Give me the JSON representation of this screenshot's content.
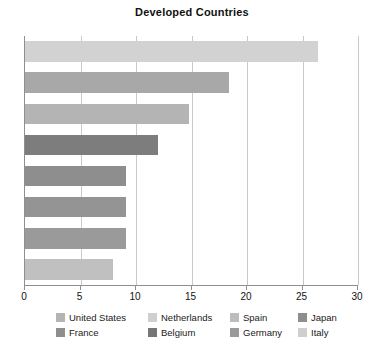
{
  "chart_data": {
    "type": "bar",
    "orientation": "horizontal",
    "title": "Developed Countries",
    "xlabel": "",
    "ylabel": "",
    "xlim": [
      0,
      30
    ],
    "xticks": [
      0,
      5,
      10,
      15,
      20,
      25,
      30
    ],
    "xtick_labels": [
      "0",
      "5",
      "10",
      "15",
      "20",
      "25",
      "30"
    ],
    "grid": "vertical",
    "legend_position": "bottom",
    "categories": [
      "United States",
      "Netherlands",
      "Spain",
      "Japan",
      "France",
      "Belgium",
      "Germany",
      "Italy"
    ],
    "values": [
      26.4,
      18.4,
      14.8,
      12.0,
      9.1,
      9.1,
      9.1,
      7.9
    ],
    "colors": [
      "#d2d2d2",
      "#a8a8a8",
      "#b4b4b4",
      "#7d7d7d",
      "#8e8e8e",
      "#949494",
      "#9a9a9a",
      "#c0c0c0"
    ],
    "bars": [
      {
        "label": "United States",
        "value": 26.4,
        "color": "#d2d2d2"
      },
      {
        "label": "Netherlands",
        "value": 18.4,
        "color": "#a8a8a8"
      },
      {
        "label": "Spain",
        "value": 14.8,
        "color": "#b4b4b4"
      },
      {
        "label": "Japan",
        "value": 12.0,
        "color": "#7d7d7d"
      },
      {
        "label": "France",
        "value": 9.1,
        "color": "#8e8e8e"
      },
      {
        "label": "Belgium",
        "value": 9.1,
        "color": "#949494"
      },
      {
        "label": "Germany",
        "value": 9.1,
        "color": "#9a9a9a"
      },
      {
        "label": "Italy",
        "value": 7.9,
        "color": "#c0c0c0"
      }
    ]
  },
  "legend": {
    "rows": [
      [
        {
          "label": "United States",
          "color": "#b4b4b4"
        },
        {
          "label": "Netherlands",
          "color": "#cfcfcf"
        },
        {
          "label": "Spain",
          "color": "#bdbdbd"
        },
        {
          "label": "Japan",
          "color": "#8e8e8e"
        }
      ],
      [
        {
          "label": "France",
          "color": "#8e8e8e"
        },
        {
          "label": "Belgium",
          "color": "#767676"
        },
        {
          "label": "Germany",
          "color": "#9a9a9a"
        },
        {
          "label": "Italy",
          "color": "#cfcfcf"
        }
      ]
    ]
  },
  "style": {
    "axis_color": "#8f8f8f",
    "grid_color": "#c9c9c9",
    "background": "#ffffff",
    "text_color": "#111111"
  }
}
